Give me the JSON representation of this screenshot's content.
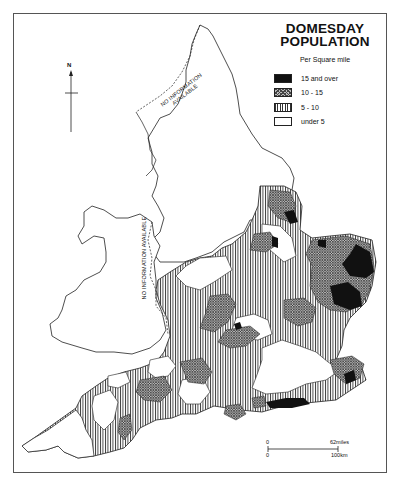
{
  "title": {
    "line1": "DOMESDAY",
    "line2": "POPULATION"
  },
  "legend": {
    "subtitle": "Per Square mile",
    "items": [
      {
        "label": "15 and over",
        "pattern": "solid-black",
        "color": "#111111"
      },
      {
        "label": "10 - 15",
        "pattern": "cross-hatch",
        "color": "#888888"
      },
      {
        "label": "5 - 10",
        "pattern": "vertical-lines",
        "color": "#333333"
      },
      {
        "label": "under 5",
        "pattern": "white",
        "color": "#ffffff"
      }
    ]
  },
  "annotations": {
    "north": "NO INFORMATION AVAILABLE",
    "north_line1": "NO INFORMATION",
    "north_line2": "AVAILABLE",
    "wales": "NO INFORMATION AVAILABLE"
  },
  "north_arrow": {
    "label": "N"
  },
  "scale_bar": {
    "miles_start": "0",
    "miles_end": "62miles",
    "km_start": "0",
    "km_end": "100km"
  }
}
